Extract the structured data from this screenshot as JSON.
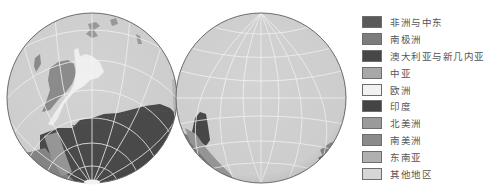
{
  "maps": {
    "left_globe": {
      "label": "globe-view-1",
      "cx": 92,
      "cy": 98,
      "r": 85
    },
    "right_globe": {
      "label": "globe-view-2",
      "cx": 261,
      "cy": 98,
      "r": 85
    }
  },
  "legend": {
    "items": [
      {
        "label": "非洲与中东",
        "color": "#5a5a5a"
      },
      {
        "label": "南极洲",
        "color": "#7c7c7c"
      },
      {
        "label": "澳大利亚与新几内亚",
        "color": "#474747"
      },
      {
        "label": "中亚",
        "color": "#a8a8a8"
      },
      {
        "label": "欧洲",
        "color": "#f2f2f2"
      },
      {
        "label": "印度",
        "color": "#444444"
      },
      {
        "label": "北美洲",
        "color": "#9a9a9a"
      },
      {
        "label": "南美洲",
        "color": "#8a8a8a"
      },
      {
        "label": "东南亚",
        "color": "#b0b0b0"
      },
      {
        "label": "其他地区",
        "color": "#d6d6d6"
      }
    ]
  },
  "colors": {
    "ocean": "#d3d3d3",
    "graticule": "#f4f4f4",
    "outline": "#6a6a6a"
  }
}
